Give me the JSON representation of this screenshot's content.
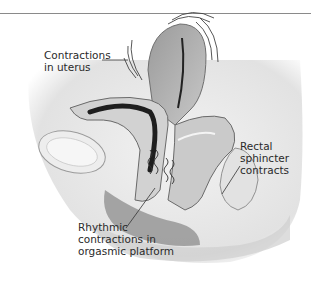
{
  "figure": {
    "labels": [
      {
        "id": "uterus",
        "text": "Contractions\nin uterus"
      },
      {
        "id": "rectal",
        "text": "Rectal\nsphincter\ncontracts"
      },
      {
        "id": "platform",
        "text": "Rhythmic\ncontractions in\norgasmic platform"
      }
    ]
  },
  "colors": {
    "rule": "#8a8a8a",
    "tissue_light": "#e6e6e6",
    "tissue_mid": "#bdbdbd",
    "tissue_dark": "#7a7a7a",
    "cavity": "#2b2b2b",
    "label": "#2a2a2a"
  }
}
